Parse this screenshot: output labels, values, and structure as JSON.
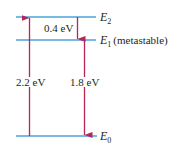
{
  "diagram": {
    "colors": {
      "level_line": "#4aa3d8",
      "arrow": "#b5245a",
      "text": "#231f20"
    },
    "levels": [
      {
        "id": "E2",
        "symbol": "E",
        "subscript": "2",
        "note": ""
      },
      {
        "id": "E1",
        "symbol": "E",
        "subscript": "1",
        "note": "(metastable)"
      },
      {
        "id": "E0",
        "symbol": "E",
        "subscript": "0",
        "note": ""
      }
    ],
    "transitions": [
      {
        "id": "pump",
        "from": "E0",
        "to": "E2",
        "direction": "up",
        "label": "2.2 eV"
      },
      {
        "id": "relax",
        "from": "E2",
        "to": "E1",
        "direction": "down",
        "label": "0.4 eV"
      },
      {
        "id": "emission",
        "from": "E1",
        "to": "E0",
        "direction": "down",
        "label": "1.8 eV"
      }
    ]
  }
}
